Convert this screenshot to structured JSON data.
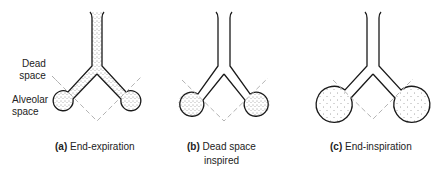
{
  "panels": [
    {
      "id": "a",
      "letter": "(a)",
      "caption": "End-expiration",
      "caption_line2": "",
      "dead_space_filled": true,
      "alveoli_filled": true,
      "alveolar_size": "small"
    },
    {
      "id": "b",
      "letter": "(b)",
      "caption": "Dead space",
      "caption_line2": "inspired",
      "dead_space_filled": false,
      "alveoli_filled": true,
      "alveolar_size": "medium"
    },
    {
      "id": "c",
      "letter": "(c)",
      "caption": "End-inspiration",
      "caption_line2": "",
      "dead_space_filled": false,
      "alveoli_filled": true,
      "alveolar_size": "large"
    }
  ],
  "annotations": {
    "dead_space_line1": "Dead",
    "dead_space_line2": "space",
    "alveolar_space_line1": "Alveolar",
    "alveolar_space_line2": "space"
  },
  "colors": {
    "outline": "#1a1a1a",
    "stipple": "#333333",
    "dashed": "#aaaaaa"
  }
}
